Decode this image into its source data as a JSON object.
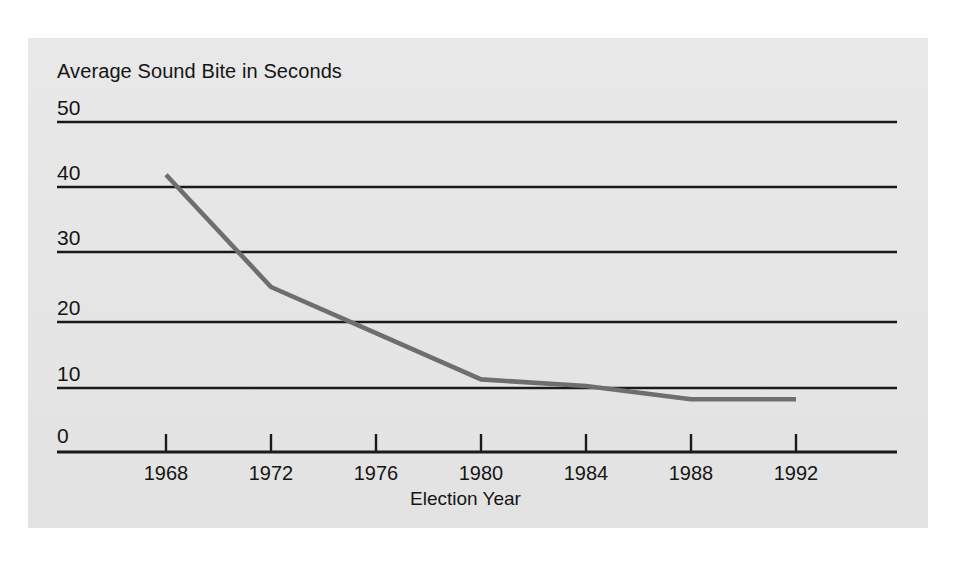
{
  "chart_data": {
    "type": "line",
    "title": "Average Sound Bite in Seconds",
    "xlabel": "Election Year",
    "ylabel": "",
    "x": [
      1968,
      1972,
      1976,
      1980,
      1984,
      1988,
      1992
    ],
    "categories": [
      "1968",
      "1972",
      "1976",
      "1980",
      "1984",
      "1988",
      "1992"
    ],
    "values": [
      42,
      25,
      18,
      11,
      10,
      8,
      8
    ],
    "series": [
      {
        "name": "Average Sound Bite in Seconds",
        "values": [
          42,
          25,
          18,
          11,
          10,
          8,
          8
        ]
      }
    ],
    "ylim": [
      0,
      50
    ],
    "yticks": [
      0,
      10,
      20,
      30,
      40,
      50
    ],
    "ytick_labels": [
      "0",
      "10",
      "20",
      "30",
      "40",
      "50"
    ],
    "xlim": [
      1966,
      1994
    ],
    "xticks": [
      1968,
      1972,
      1976,
      1980,
      1984,
      1988,
      1992
    ],
    "grid": "horizontal",
    "legend": "none",
    "line_color": "#6e6e6e",
    "grid_color": "#1a1a1a",
    "axis_color": "#1a1a1a",
    "panel_color": "#e6e6e6",
    "text_color": "#151515"
  }
}
